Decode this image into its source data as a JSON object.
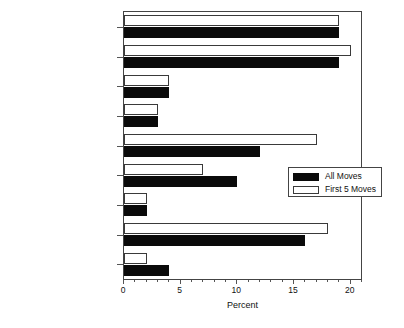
{
  "chart_data": {
    "type": "bar",
    "orientation": "horizontal",
    "title": "",
    "xlabel": "Percent",
    "ylabel": "",
    "xlim": [
      0,
      21
    ],
    "xticks": [
      0,
      5,
      10,
      15,
      20
    ],
    "xticklabels": [
      "0",
      "5",
      "10",
      "15",
      "20"
    ],
    "grid": false,
    "legend_position": "center-right",
    "categories": [
      "Test Scores",
      "Students",
      "Staff",
      "Special Programs",
      "Location",
      "Facility",
      "Community",
      "Basic Programs",
      "After School Programs"
    ],
    "series": [
      {
        "name": "All Moves",
        "color": "#0a0a0a",
        "values": [
          19,
          19,
          4,
          3,
          12,
          10,
          2,
          16,
          4
        ]
      },
      {
        "name": "First 5 Moves",
        "color": "#ffffff",
        "values": [
          19,
          20,
          4,
          3,
          17,
          7,
          2,
          18,
          2
        ]
      }
    ]
  },
  "legend": {
    "items": [
      {
        "label": "All Moves",
        "swatch": "all"
      },
      {
        "label": "First 5 Moves",
        "swatch": "first5"
      }
    ]
  }
}
